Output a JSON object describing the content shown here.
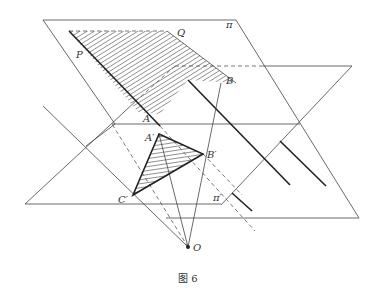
{
  "figure": {
    "caption": "图 6",
    "planes": {
      "pi": "π",
      "pi_prime": "π′"
    },
    "points": {
      "P": "P",
      "Q": "Q",
      "A": "A",
      "B": "B",
      "A_prime": "A′",
      "B_prime": "B′",
      "C_prime": "C′",
      "O": "O"
    },
    "colors": {
      "line": "#444444",
      "thick": "#222222",
      "background": "#ffffff"
    }
  }
}
